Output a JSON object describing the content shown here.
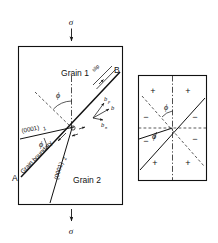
{
  "figure": {
    "panels": [
      "left-bicrystal-panel",
      "right-sign-convention-panel"
    ]
  },
  "stress": {
    "top_symbol": "σ",
    "bottom_symbol": "σ",
    "top_arrow": "arrow-down",
    "bottom_arrow": "arrow-down",
    "axis": "vertical-tensile-axis"
  },
  "left_panel": {
    "grain_upper": "Grain 1",
    "grain_lower": "Grain 2",
    "boundary_end_left": "A",
    "boundary_end_right": "B",
    "boundary_label": "Grain boundary",
    "basal_plane_1": "(0001)",
    "basal_plane_1_subscript": "1",
    "basal_plane_2": "(0001)",
    "basal_plane_2_subscript": "2",
    "slip_label": "slip",
    "angle_phi_upper": "ϕ",
    "angle_phi_lower": "ϕ",
    "burgers_vector": "b",
    "burgers_parallel": "b",
    "burgers_parallel_subscript": "p",
    "burgers_normal": "b",
    "burgers_normal_subscript": "n"
  },
  "right_panel": {
    "angle_phi_upper": "ϕ",
    "angle_phi_lower": "ϕ",
    "signs": [
      {
        "id": "quadrant-top-left",
        "value": "+"
      },
      {
        "id": "quadrant-top-right",
        "value": "+"
      },
      {
        "id": "quadrant-midleft-upper",
        "value": "−"
      },
      {
        "id": "quadrant-midright-upper",
        "value": "−"
      },
      {
        "id": "quadrant-midleft-lower",
        "value": "−"
      },
      {
        "id": "quadrant-midright-lower",
        "value": "−"
      },
      {
        "id": "quadrant-bottom-left",
        "value": "+"
      },
      {
        "id": "quadrant-bottom-right",
        "value": "+"
      }
    ]
  },
  "colors": {
    "ink": "#111111",
    "paper": "#ffffff"
  }
}
